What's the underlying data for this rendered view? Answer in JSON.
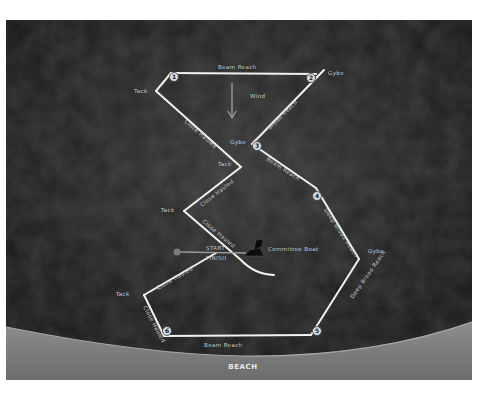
{
  "diagram": {
    "title": "",
    "wind_label": "Wind",
    "shore_label": "BEACH",
    "committee_boat_label": "Committee Boat",
    "start_label": "START",
    "finish_label": "FINISH",
    "marks": [
      {
        "id": "1",
        "label": "1"
      },
      {
        "id": "2",
        "label": "2"
      },
      {
        "id": "3",
        "label": "3"
      },
      {
        "id": "4",
        "label": "4"
      },
      {
        "id": "5",
        "label": "5"
      },
      {
        "id": "6",
        "label": "6"
      }
    ],
    "maneuvers": {
      "tack_top_left": "Tack",
      "gybe_top_right": "Gybe",
      "gybe_mark3": "Gybe",
      "tack_mid": "Tack",
      "tack_left": "Tack",
      "gybe_right": "Gybe",
      "tack_bottom_left": "Tack"
    },
    "legs": {
      "leg_1_2": "Beam Reach",
      "leg_2_3": "Broad Reach",
      "leg_tack_1": "Close Hauled",
      "leg_3_4": "Beam Reach",
      "leg_4_gybe": "Deep Broad Reach",
      "leg_gybe_5": "Deep Broad Reach",
      "leg_5_6": "Beam Reach",
      "leg_tack_mid_upper": "Close Hauled",
      "leg_tack_mid_lower": "Close Hauled",
      "leg_start_tack": "Close Hauled",
      "leg_tack_6": "Close Hauled"
    }
  }
}
